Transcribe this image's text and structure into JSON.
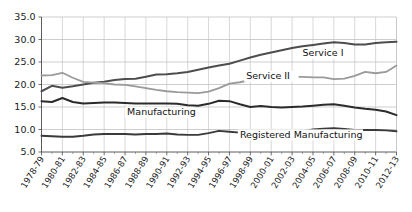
{
  "chart_data": {
    "type": "line",
    "title": "",
    "subtitle": "",
    "xlabel": "",
    "ylabel": "",
    "ylim": [
      5.0,
      35.0
    ],
    "ytick_labels": [
      "5.0",
      "10.0",
      "15.0",
      "20.0",
      "25.0",
      "30.0",
      "35.0"
    ],
    "ytick_values": [
      5.0,
      10.0,
      15.0,
      20.0,
      25.0,
      30.0,
      35.0
    ],
    "grid": true,
    "grid_axes": "both",
    "legend_position": "inline-annotations",
    "x": [
      "1978-79",
      "1979-80",
      "1980-81",
      "1981-82",
      "1982-83",
      "1983-84",
      "1984-85",
      "1985-86",
      "1986-87",
      "1987-88",
      "1988-89",
      "1989-90",
      "1990-91",
      "1991-92",
      "1992-93",
      "1993-94",
      "1994-95",
      "1995-96",
      "1996-97",
      "1997-98",
      "1998-99",
      "1999-00",
      "2000-01",
      "2001-02",
      "2002-03",
      "2003-04",
      "2004-05",
      "2005-06",
      "2006-07",
      "2007-08",
      "2008-09",
      "2009-10",
      "2010-11",
      "2011-12",
      "2012-13"
    ],
    "xtick_labels": [
      "1978-79",
      "1980-81",
      "1982-83",
      "1984-85",
      "1986-87",
      "1988-89",
      "1990-91",
      "1992-93",
      "1994-95",
      "1996-97",
      "1998-99",
      "2000-01",
      "2002-03",
      "2004-05",
      "2006-07",
      "2008-09",
      "2010-11",
      "2012-13"
    ],
    "xtick_indices": [
      0,
      2,
      4,
      6,
      8,
      10,
      12,
      14,
      16,
      18,
      20,
      22,
      24,
      26,
      28,
      30,
      32,
      34
    ],
    "series": [
      {
        "name": "Service I",
        "label": "Service I",
        "color": "#4d4d4d",
        "width": 2.0,
        "label_x_index": 25.0,
        "label_y_value": 26.3,
        "values": [
          18.5,
          19.7,
          19.3,
          19.6,
          20.0,
          20.4,
          20.6,
          21.0,
          21.2,
          21.3,
          21.7,
          22.2,
          22.3,
          22.5,
          22.8,
          23.3,
          23.8,
          24.2,
          24.6,
          25.3,
          26.0,
          26.6,
          27.1,
          27.6,
          28.1,
          28.5,
          28.8,
          29.1,
          29.4,
          29.2,
          28.9,
          28.9,
          29.2,
          29.4,
          29.5
        ]
      },
      {
        "name": "Service II",
        "label": "Service II",
        "color": "#9a9a9a",
        "width": 1.8,
        "label_x_index": 19.6,
        "label_y_value": 21.2,
        "values": [
          22.0,
          22.1,
          22.6,
          21.5,
          20.6,
          20.4,
          20.3,
          20.0,
          19.9,
          19.6,
          19.2,
          18.8,
          18.5,
          18.3,
          18.2,
          18.1,
          18.4,
          19.2,
          20.2,
          20.5,
          21.0,
          21.4,
          21.6,
          21.6,
          21.7,
          21.7,
          21.6,
          21.6,
          21.2,
          21.3,
          21.9,
          22.8,
          22.5,
          22.8,
          24.2
        ]
      },
      {
        "name": "Manufacturing",
        "label": "Manufacturing",
        "color": "#2b2b2b",
        "width": 2.0,
        "label_x_index": 8.2,
        "label_y_value": 13.2,
        "values": [
          16.3,
          16.1,
          17.0,
          16.1,
          15.8,
          15.9,
          16.0,
          16.0,
          15.9,
          15.8,
          15.8,
          15.8,
          15.8,
          15.7,
          15.4,
          15.3,
          15.7,
          16.4,
          16.3,
          15.6,
          15.0,
          15.2,
          15.0,
          14.9,
          15.0,
          15.1,
          15.3,
          15.5,
          15.6,
          15.3,
          14.9,
          14.6,
          14.4,
          14.0,
          13.2
        ]
      },
      {
        "name": "Registered Manufacturing",
        "label": "Registered Manufacturing",
        "color": "#3a3a3a",
        "width": 1.9,
        "label_x_index": 19.0,
        "label_y_value": 8.2,
        "values": [
          8.6,
          8.5,
          8.4,
          8.4,
          8.6,
          8.9,
          9.0,
          9.0,
          9.0,
          8.9,
          9.0,
          9.0,
          9.1,
          8.9,
          8.8,
          8.8,
          9.2,
          9.7,
          9.5,
          9.3,
          9.1,
          9.3,
          9.2,
          9.3,
          9.4,
          9.6,
          10.0,
          10.2,
          10.3,
          10.1,
          9.9,
          9.9,
          9.9,
          9.8,
          9.6
        ]
      }
    ]
  }
}
